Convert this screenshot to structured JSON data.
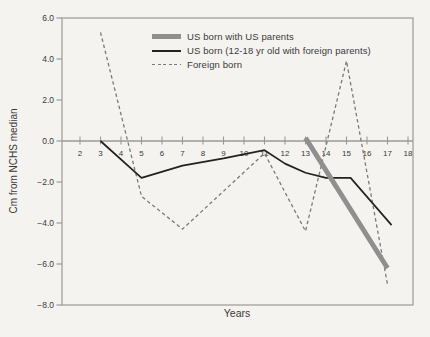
{
  "colors": {
    "background": "#f4f3f0",
    "axis": "#9a9a9a",
    "text": "#3a3a3a"
  },
  "chart_data": {
    "type": "line",
    "title": "",
    "xlabel": "Years",
    "ylabel": "Cm from NCHS median",
    "xlim": [
      2,
      18
    ],
    "ylim": [
      -8,
      6
    ],
    "grid": false,
    "legend_position": "top-center",
    "xticks": [
      2,
      3,
      4,
      5,
      6,
      7,
      8,
      9,
      10,
      11,
      12,
      13,
      14,
      15,
      16,
      17,
      18
    ],
    "yticks": [
      6,
      4,
      2,
      0,
      -2,
      -4,
      -6,
      -8
    ],
    "ytick_labels": [
      "6.0",
      "4.0",
      "2.0",
      "0.0",
      "−2.0",
      "−4.0",
      "−6.0",
      "−8.0"
    ],
    "series": [
      {
        "name": "US born with US parents",
        "line_style": "thick-solid",
        "color": "#8f8f8f",
        "stroke_width": 4.8,
        "dash": "",
        "points": [
          [
            13,
            0.15
          ],
          [
            17,
            -6.2
          ]
        ]
      },
      {
        "name": "US born (12-18 yr old with foreign parents)",
        "line_style": "solid",
        "color": "#222222",
        "stroke_width": 1.7,
        "dash": "",
        "points": [
          [
            3,
            0
          ],
          [
            5,
            -1.8
          ],
          [
            7,
            -1.2
          ],
          [
            9,
            -0.85
          ],
          [
            11,
            -0.45
          ],
          [
            12,
            -1.1
          ],
          [
            13,
            -1.55
          ],
          [
            14,
            -1.8
          ],
          [
            15.2,
            -1.8
          ],
          [
            17.2,
            -4.1
          ]
        ]
      },
      {
        "name": "Foreign born",
        "line_style": "dashed",
        "color": "#7a7a7a",
        "stroke_width": 1.3,
        "dash": "3.5 2.8",
        "points": [
          [
            3,
            5.3
          ],
          [
            5,
            -2.7
          ],
          [
            7,
            -4.3
          ],
          [
            9,
            -2.45
          ],
          [
            11,
            -0.6
          ],
          [
            13,
            -4.4
          ],
          [
            15,
            3.9
          ],
          [
            17,
            -7.0
          ]
        ]
      }
    ]
  }
}
